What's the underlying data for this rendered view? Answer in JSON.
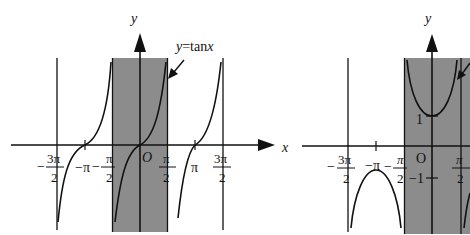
{
  "figure": {
    "left_graph": {
      "function_label": "y=tanx",
      "function_label_parts": {
        "y": "y",
        "eq": "=tan",
        "x": "x"
      },
      "axis_x_label": "x",
      "axis_y_label": "y",
      "origin_label": "O",
      "shaded_interval": "(-π/2, π/2)",
      "x_ticks": [
        {
          "num": "3π",
          "den": "2",
          "sign": "−",
          "value": "-3π/2"
        },
        {
          "text": "−π",
          "value": "-π"
        },
        {
          "num": "π",
          "den": "2",
          "sign": "−",
          "value": "-π/2"
        },
        {
          "num": "π",
          "den": "2",
          "sign": "",
          "value": "π/2"
        },
        {
          "text": "π",
          "value": "π"
        },
        {
          "num": "3π",
          "den": "2",
          "sign": "",
          "value": "3π/2"
        }
      ],
      "asymptotes": [
        "-3π/2",
        "-π/2",
        "π/2",
        "3π/2"
      ]
    },
    "right_graph": {
      "axis_y_label": "y",
      "origin_label": "O",
      "y_tick_pos": "1",
      "y_tick_neg": "−1",
      "shaded_interval": "(-π/2, π/2)",
      "x_ticks": [
        {
          "num": "3π",
          "den": "2",
          "sign": "−",
          "value": "-3π/2"
        },
        {
          "text": "−π",
          "value": "-π"
        },
        {
          "num": "π",
          "den": "2",
          "sign": "−",
          "value": "-π/2"
        },
        {
          "num": "π",
          "den": "2",
          "sign": "",
          "value": "π/2"
        }
      ],
      "asymptotes": [
        "-3π/2",
        "-π/2",
        "π/2"
      ],
      "note": "cosecant/secant-type curve, partially cut off at right edge"
    },
    "colors": {
      "shade": "#8c8c8c",
      "stroke": "#111111",
      "background": "#ffffff"
    }
  }
}
